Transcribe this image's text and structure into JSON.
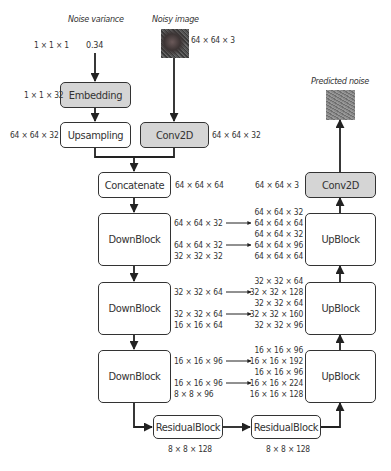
{
  "inputs": {
    "noise_variance": {
      "title": "Noise variance",
      "value": "0.34",
      "shape": "1 × 1 × 1"
    },
    "noisy_image": {
      "title": "Noisy image",
      "shape": "64 × 64 × 3"
    }
  },
  "output": {
    "title": "Predicted noise"
  },
  "blocks": {
    "embedding": {
      "label": "Embedding",
      "shape": "1 × 1 × 32"
    },
    "upsampling": {
      "label": "Upsampling",
      "shape": "64 × 64 × 32"
    },
    "conv2d_in": {
      "label": "Conv2D",
      "shape": "64 × 64 × 32"
    },
    "concatenate": {
      "label": "Concatenate",
      "shape": "64 × 64 × 64"
    },
    "down1": {
      "label": "DownBlock",
      "skip1": "64 × 64 × 32",
      "skip2": "64 × 64 × 32",
      "out": "32 × 32 × 32"
    },
    "down2": {
      "label": "DownBlock",
      "skip1": "32 × 32 × 64",
      "skip2": "32 × 32 × 64",
      "out": "16 × 16 × 64"
    },
    "down3": {
      "label": "DownBlock",
      "skip1": "16 × 16 × 96",
      "skip2": "16 × 16 × 96",
      "out": "8 × 8 × 96"
    },
    "res1": {
      "label": "ResidualBlock",
      "shape": "8 × 8 × 128"
    },
    "res2": {
      "label": "ResidualBlock",
      "shape": "8 × 8 × 128"
    },
    "up3": {
      "label": "UpBlock",
      "lines": [
        "16 × 16 × 96",
        "16 × 16 × 192",
        "16 × 16 × 96",
        "16 × 16 × 224",
        "16 × 16 × 128"
      ]
    },
    "up2": {
      "label": "UpBlock",
      "lines": [
        "32 × 32 × 64",
        "32 × 32 × 128",
        "32 × 32 × 64",
        "32 × 32 × 160",
        "32 × 32 × 96"
      ]
    },
    "up1": {
      "label": "UpBlock",
      "lines": [
        "64 × 64 × 32",
        "64 × 64 × 64",
        "64 × 64 × 32",
        "64 × 64 × 96",
        "64 × 64 × 64"
      ]
    },
    "conv2d_out": {
      "label": "Conv2D",
      "shape": "64 × 64 × 3"
    }
  },
  "colors": {
    "stroke": "#333333",
    "box_fill": "#ffffff",
    "box_fill_gray": "#d5d5d5",
    "text": "#333333"
  }
}
